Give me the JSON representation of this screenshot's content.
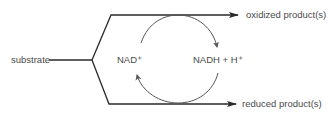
{
  "diagram": {
    "type": "redox-reaction-scheme",
    "labels": {
      "substrate": "substrate",
      "oxidized_products": "oxidized product(s)",
      "reduced_products": "reduced product(s)",
      "nad_plus": "NAD⁺",
      "nadh": "NADH + H⁺"
    },
    "colors": {
      "line": "#2a2a2a",
      "arc": "#555555",
      "text": "#4a4a4a"
    }
  }
}
